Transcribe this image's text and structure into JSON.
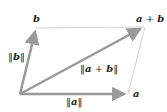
{
  "diagram": {
    "type": "vector-parallelogram",
    "colors": {
      "arrow": "#9a9a9a",
      "edge": "#d4d4d4",
      "text": "#222222",
      "background": "#ffffff"
    },
    "points": {
      "origin": [
        20,
        94
      ],
      "a": [
        127,
        94
      ],
      "b": [
        36,
        28
      ],
      "a_plus_b": [
        144,
        27
      ]
    },
    "vectors": [
      {
        "name": "a",
        "from": "origin",
        "to": "a"
      },
      {
        "name": "b",
        "from": "origin",
        "to": "b"
      },
      {
        "name": "a+b",
        "from": "origin",
        "to": "a_plus_b"
      }
    ],
    "edges": [
      {
        "from": "b",
        "to": "a_plus_b"
      },
      {
        "from": "a",
        "to": "a_plus_b"
      }
    ],
    "labels": {
      "b_point": "b",
      "a_point": "a",
      "sum_point_a": "a",
      "sum_point_op": " + ",
      "sum_point_b": "b",
      "norm_b_left": "‖",
      "norm_b_vec": "b",
      "norm_b_right": "‖",
      "norm_a_left": "‖",
      "norm_a_vec": "a",
      "norm_a_right": "‖",
      "norm_sum_left": "‖",
      "norm_sum_a": "a",
      "norm_sum_op": " + ",
      "norm_sum_b": "b",
      "norm_sum_right": "‖"
    }
  }
}
